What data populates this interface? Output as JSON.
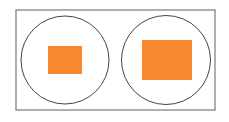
{
  "diagram": {
    "colors": {
      "frame_stroke": "#7a7a7a",
      "circle_stroke": "#444444",
      "fill": "#f7882f",
      "background": "#ffffff"
    },
    "frame": {
      "x": 16,
      "y": 10,
      "width": 199,
      "height": 100
    },
    "figures": [
      {
        "label": "left",
        "circle": {
          "cx": 65,
          "cy": 60,
          "r": 44
        },
        "rect": {
          "x": 48,
          "y": 46,
          "width": 34,
          "height": 28
        }
      },
      {
        "label": "right",
        "circle": {
          "cx": 166,
          "cy": 60,
          "r": 44.5
        },
        "rect": {
          "x": 142,
          "y": 40,
          "width": 50,
          "height": 40
        }
      }
    ]
  }
}
